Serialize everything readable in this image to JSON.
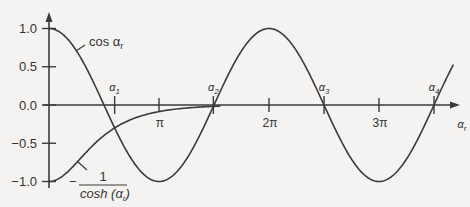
{
  "chart_data": {
    "type": "line",
    "title": "",
    "xlabel": "α_r",
    "ylabel": "",
    "xlim": [
      0,
      12.3
    ],
    "ylim": [
      -1.0,
      1.0
    ],
    "grid": false,
    "legend_position": "inline",
    "y_ticks": [
      {
        "value": 1.0,
        "label": "1.0"
      },
      {
        "value": 0.5,
        "label": "0.5"
      },
      {
        "value": 0.0,
        "label": "0.0"
      },
      {
        "value": -0.5,
        "label": "−0.5"
      },
      {
        "value": -1.0,
        "label": "−1.0"
      }
    ],
    "x_ticks": [
      {
        "value": 3.14159,
        "label": "π"
      },
      {
        "value": 6.28319,
        "label": "2π"
      },
      {
        "value": 9.42478,
        "label": "3π"
      }
    ],
    "series": [
      {
        "name": "cos α_r",
        "function": "cos(x)",
        "label_text": "cos α",
        "label_sub": "r"
      },
      {
        "name": "−1/cosh(α_r)",
        "function": "-1/cosh(x)",
        "label_prefix": "−",
        "label_num": "1",
        "label_den": "cosh (α",
        "label_den_sub": "r",
        "label_den_close": ")"
      }
    ],
    "annotations": [
      {
        "label": "α",
        "sub": "1",
        "x": 1.8751
      },
      {
        "label": "α",
        "sub": "2",
        "x": 4.6941
      },
      {
        "label": "α",
        "sub": "3",
        "x": 7.8548
      },
      {
        "label": "α",
        "sub": "4",
        "x": 10.9955
      }
    ],
    "axis_label_x": "α",
    "axis_label_x_sub": "r"
  },
  "colors": {
    "background": "#f4f3f1",
    "line": "#3a3a3a",
    "text": "#333333"
  }
}
